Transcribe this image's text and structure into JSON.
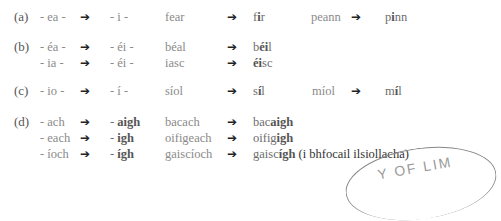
{
  "rules": {
    "a": {
      "label": "(a)",
      "rows": [
        {
          "from": "- ea -",
          "to": "- i -",
          "example": "fear",
          "result_pre": "f",
          "result_bold": "i",
          "result_post": "r",
          "example2": "peann",
          "result2_pre": "p",
          "result2_bold": "i",
          "result2_post": "nn"
        }
      ]
    },
    "b": {
      "label": "(b)",
      "rows": [
        {
          "from": "- éa -",
          "to": "- éi -",
          "example": "béal",
          "result_pre": "b",
          "result_bold": "éi",
          "result_post": "l"
        },
        {
          "from": "- ia -",
          "to": "- éi -",
          "example": "iasc",
          "result_pre": "",
          "result_bold": "éi",
          "result_post": "sc"
        }
      ]
    },
    "c": {
      "label": "(c)",
      "rows": [
        {
          "from": "- io -",
          "to": "- í -",
          "example": "síol",
          "result_pre": "s",
          "result_bold": "í",
          "result_post": "l",
          "example2": "míol",
          "result2_pre": "m",
          "result2_bold": "í",
          "result2_post": "l"
        }
      ]
    },
    "d": {
      "label": "(d)",
      "rows": [
        {
          "from": "- ach",
          "to_dash": "- ",
          "to_bold": "aigh",
          "example": "bacach",
          "result_pre": "bac",
          "result_bold": "aigh",
          "result_post": ""
        },
        {
          "from": "- each",
          "to_dash": "- ",
          "to_bold": "igh",
          "example": "oifigeach",
          "result_pre": "oifig",
          "result_bold": "igh",
          "result_post": ""
        },
        {
          "from": "- íoch",
          "to_dash": "- ",
          "to_bold": "ígh",
          "example": "gaiscíoch",
          "result_pre": "gaisc",
          "result_bold": "ígh",
          "result_post": "",
          "note": "(i bhfocail ilsiollacha)"
        }
      ]
    }
  },
  "arrow_glyph": "➔",
  "stamp": {
    "text": "Y OF LIM"
  }
}
